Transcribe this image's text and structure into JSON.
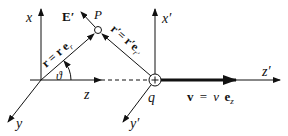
{
  "diagram": {
    "colors": {
      "ink": "#111111",
      "background": "#ffffff"
    },
    "frame_unprimed": {
      "axis_x": "x",
      "axis_y": "y",
      "axis_z": "z",
      "position_vector": "r = r e",
      "position_vector_sub": "r",
      "angle": "ϑ"
    },
    "frame_primed": {
      "axis_x": "x′",
      "axis_y": "y′",
      "axis_z": "z′",
      "position_vector": "r′= r′e",
      "position_vector_sub": "r′"
    },
    "point": {
      "label": "P"
    },
    "field": {
      "label": "E′"
    },
    "charge": {
      "label": "q",
      "symbol": "+"
    },
    "velocity": {
      "label_lhs": "v",
      "label_eq": "=",
      "label_rhs": "v",
      "label_unit": "e",
      "label_unit_sub": "z"
    }
  }
}
